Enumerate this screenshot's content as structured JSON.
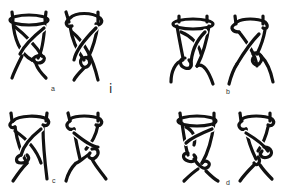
{
  "figure": {
    "stroke_color": "#111111",
    "background": "#ffffff",
    "panels": [
      {
        "id": "a",
        "label": "a",
        "figures": [
          "knot-a-left",
          "knot-a-right"
        ]
      },
      {
        "id": "b",
        "label": "b",
        "figures": [
          "knot-b-left",
          "knot-b-right"
        ]
      },
      {
        "id": "c",
        "label": "c",
        "figures": [
          "knot-c-left",
          "knot-c-right"
        ]
      },
      {
        "id": "d",
        "label": "d",
        "figures": [
          "knot-d-left",
          "knot-d-right"
        ]
      }
    ],
    "stray_mark": "i"
  }
}
